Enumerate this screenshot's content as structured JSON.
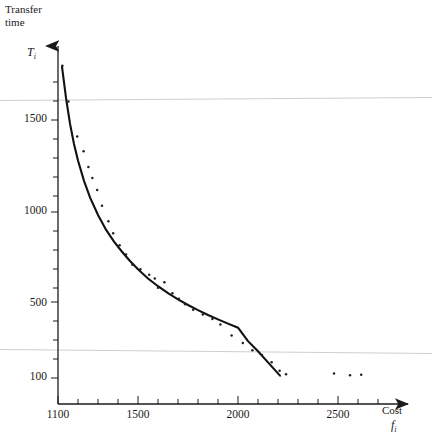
{
  "chart_data": {
    "type": "scatter",
    "title": "",
    "subtitle": "",
    "ylabel": "Transfer\ntime",
    "ylabel_line1": "Transfer",
    "ylabel_line2": "time",
    "ylabel_variable": "T",
    "ylabel_variable_sub": "i",
    "xlabel": "Cost",
    "xlabel_variable": "f",
    "xlabel_variable_sub": "i",
    "xlabel_tick_labels": [
      "1100",
      "1500",
      "2000",
      "2500"
    ],
    "xlabel_tick_values": [
      1100,
      1500,
      2000,
      2500
    ],
    "ylabel_tick_labels": [
      "1500",
      "1000",
      "500",
      "100"
    ],
    "ylabel_tick_values": [
      1500,
      1000,
      500,
      100
    ],
    "xlim": [
      1100,
      2700
    ],
    "ylim": [
      100,
      1900
    ],
    "x_minor_tick_step": 100,
    "y_minor_tick_step": 100,
    "grid": false,
    "legend": "none",
    "axis_style": "arrow-ended",
    "series": [
      {
        "name": "fitted curve",
        "type": "line",
        "x": [
          1120,
          1140,
          1160,
          1180,
          1200,
          1230,
          1260,
          1300,
          1340,
          1380,
          1420,
          1460,
          1500,
          1550,
          1600,
          1650,
          1700,
          1750,
          1800,
          1850,
          1900,
          1950,
          2000,
          2050,
          2100,
          2150,
          2210
        ],
        "y": [
          1790,
          1620,
          1480,
          1370,
          1280,
          1170,
          1080,
          985,
          905,
          840,
          785,
          735,
          690,
          640,
          598,
          560,
          527,
          496,
          468,
          442,
          418,
          395,
          373,
          300,
          245,
          185,
          113
        ]
      },
      {
        "name": "observations",
        "type": "scatter",
        "x": [
          1122,
          1152,
          1196,
          1228,
          1252,
          1272,
          1296,
          1320,
          1352,
          1376,
          1408,
          1440,
          1472,
          1512,
          1556,
          1584,
          1600,
          1632,
          1672,
          1704,
          1736,
          1776,
          1824,
          1872,
          1912,
          1968,
          2024,
          2072,
          2120,
          2168,
          2208,
          2240,
          2480,
          2560,
          2616
        ],
        "y": [
          1795,
          1600,
          1410,
          1330,
          1245,
          1185,
          1120,
          1035,
          950,
          885,
          820,
          770,
          715,
          690,
          660,
          640,
          590,
          620,
          560,
          530,
          500,
          470,
          445,
          420,
          390,
          330,
          290,
          250,
          225,
          185,
          140,
          120,
          125,
          115,
          118
        ]
      }
    ],
    "annotations": [
      {
        "name": "scan-line-upper",
        "type": "faint-horizontal-line",
        "y_px": 99
      },
      {
        "name": "scan-line-lower",
        "type": "faint-horizontal-line",
        "y_px": 351
      }
    ]
  },
  "axes": {
    "y_title_line1": "Transfer",
    "y_title_line2": "time",
    "y_var": "T",
    "y_var_sub": "i",
    "x_title": "Cost",
    "x_var": "f",
    "x_var_sub": "i"
  },
  "colors": {
    "background": "#ffffff",
    "axis": "#1b1b1b",
    "curve": "#111111",
    "points": "#222222",
    "faint_line": "#c9c9c9",
    "text": "#1a1a1a"
  }
}
